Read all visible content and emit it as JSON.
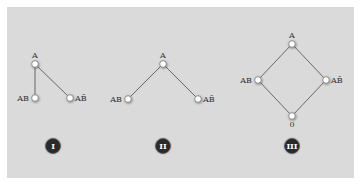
{
  "colors": {
    "panel_bg": "#dadada",
    "edge": "#666666",
    "node_fill": "#ffffff",
    "node_stroke": "#777777",
    "badge_bg": "#2a2a2a",
    "badge_ring": "#555555",
    "label": "#333333"
  },
  "diagrams": [
    {
      "id": "I",
      "badge": "I",
      "nodes": [
        {
          "label": "A",
          "x": 35,
          "y": 64,
          "label_pos": "top"
        },
        {
          "label": "AB",
          "x": 35,
          "y": 98,
          "label_pos": "left"
        },
        {
          "label": "AB̄",
          "x": 70,
          "y": 98,
          "label_pos": "right"
        }
      ],
      "edges": [
        [
          0,
          1
        ],
        [
          0,
          2
        ]
      ],
      "badge_pos": {
        "x": 53,
        "y": 146
      }
    },
    {
      "id": "II",
      "badge": "II",
      "nodes": [
        {
          "label": "A",
          "x": 163,
          "y": 64,
          "label_pos": "top"
        },
        {
          "label": "AB",
          "x": 128,
          "y": 99,
          "label_pos": "left"
        },
        {
          "label": "AB̄",
          "x": 198,
          "y": 99,
          "label_pos": "right"
        }
      ],
      "edges": [
        [
          0,
          1
        ],
        [
          0,
          2
        ]
      ],
      "badge_pos": {
        "x": 163,
        "y": 146
      }
    },
    {
      "id": "III",
      "badge": "III",
      "nodes": [
        {
          "label": "A",
          "x": 292,
          "y": 44,
          "label_pos": "top"
        },
        {
          "label": "AB",
          "x": 258,
          "y": 80,
          "label_pos": "left"
        },
        {
          "label": "AB̄",
          "x": 326,
          "y": 80,
          "label_pos": "right"
        },
        {
          "label": "0",
          "x": 292,
          "y": 116,
          "label_pos": "bottom"
        }
      ],
      "edges": [
        [
          0,
          1
        ],
        [
          0,
          2
        ],
        [
          1,
          3
        ],
        [
          2,
          3
        ]
      ],
      "badge_pos": {
        "x": 292,
        "y": 146
      }
    }
  ]
}
